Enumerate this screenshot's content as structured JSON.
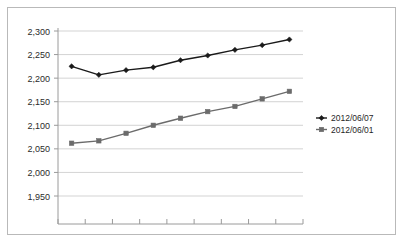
{
  "chart_data": {
    "type": "line",
    "title": "",
    "subtitle": "",
    "xlabel": "",
    "ylabel": "",
    "ylim": [
      1950,
      2300
    ],
    "y_ticks": [
      1950,
      2000,
      2050,
      2100,
      2150,
      2200,
      2250,
      2300
    ],
    "y_tick_labels": [
      "1,950",
      "2,000",
      "2,050",
      "2,100",
      "2,150",
      "2,200",
      "2,250",
      "2,300"
    ],
    "x": [
      1,
      2,
      3,
      4,
      5,
      6,
      7,
      8,
      9
    ],
    "x_tick_labels": [
      "",
      "",
      "",
      "",
      "",
      "",
      "",
      "",
      ""
    ],
    "grid": "horizontal",
    "legend_position": "right",
    "series": [
      {
        "name": "2012/06/07",
        "color": "#1a1a1a",
        "marker": "diamond",
        "values": [
          2225,
          2207,
          2217,
          2223,
          2238,
          2248,
          2260,
          2270,
          2282
        ]
      },
      {
        "name": "2012/06/01",
        "color": "#6b6b6b",
        "marker": "square",
        "values": [
          2062,
          2067,
          2083,
          2100,
          2115,
          2129,
          2140,
          2156,
          2172
        ]
      }
    ]
  },
  "axes": {
    "gridline_color": "#c8c8c8",
    "axis_color": "#9a9a9a",
    "border_color": "#b9b9b9"
  },
  "legend": {
    "entries": [
      {
        "label": "2012/06/07",
        "marker": "diamond-marker",
        "color": "#1a1a1a"
      },
      {
        "label": "2012/06/01",
        "marker": "square-marker",
        "color": "#6b6b6b"
      }
    ]
  }
}
